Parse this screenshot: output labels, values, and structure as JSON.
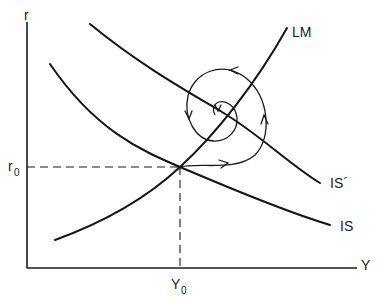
{
  "diagram": {
    "type": "IS-LM diagram",
    "axes": {
      "y_label": "r",
      "x_label": "Y"
    },
    "equilibrium": {
      "r_label": "r",
      "r_subscript": "0",
      "y_label": "Y",
      "y_subscript": "0"
    },
    "curves": [
      {
        "id": "is",
        "label": "IS",
        "shape": "downward-sloping"
      },
      {
        "id": "is-prime",
        "label": "IS´",
        "shape": "downward-sloping"
      },
      {
        "id": "lm",
        "label": "LM",
        "shape": "upward-sloping"
      }
    ],
    "adjustment_path": {
      "description": "Counter-clockwise spiral from (Y0, r0) converging to the intersection of IS´ and LM",
      "direction": "counter-clockwise",
      "arrows": [
        "right",
        "up",
        "left",
        "down",
        "down"
      ]
    }
  }
}
